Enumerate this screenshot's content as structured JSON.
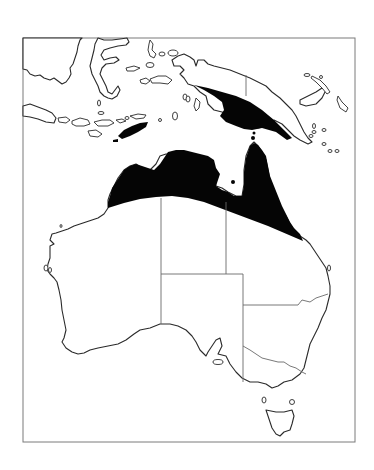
{
  "map": {
    "type": "species distribution range map",
    "region": "Australia, New Guinea and eastern Indonesia",
    "legend": null,
    "colors": {
      "range_fill": "#050505",
      "coastline": "#2a2a2a",
      "state_borders": "#6a6a6a",
      "frame": "#7a7a7a",
      "background": "#ffffff"
    },
    "range_areas": [
      "northern Australia (Kimberley, Top End, Cape York)",
      "southern New Guinea",
      "Timor"
    ],
    "features": [
      "Borneo (partial)",
      "Sulawesi",
      "Java",
      "Lesser Sunda Islands",
      "Maluku",
      "New Guinea",
      "New Britain",
      "Australia with state borders",
      "Tasmania"
    ]
  }
}
